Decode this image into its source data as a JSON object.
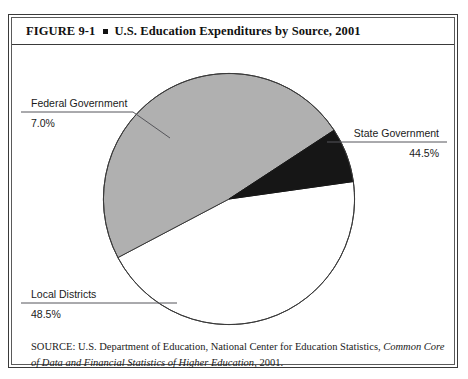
{
  "figure": {
    "number": "FIGURE  9-1",
    "separator_icon": "square-bullet-icon",
    "title": "U.S. Education Expenditures by Source, 2001"
  },
  "chart_data": {
    "type": "pie",
    "title": "U.S. Education Expenditures by Source, 2001",
    "categories": [
      "Local Districts",
      "State Government",
      "Federal Government"
    ],
    "values": [
      48.5,
      44.5,
      7.0
    ],
    "value_labels": [
      "48.5%",
      "44.5%",
      "7.0%"
    ],
    "units": "percent",
    "colors": [
      "#b0b0b0",
      "#ffffff",
      "#161616"
    ],
    "slice_order_clockwise": [
      "State Government",
      "Local Districts",
      "Federal Government"
    ],
    "start_angle_deg": -8,
    "legend": "none",
    "labels_position": "external-callouts-with-leader-lines",
    "grid": false,
    "slices": [
      {
        "name": "State Government",
        "value": 44.5,
        "label": "44.5%",
        "color": "#ffffff",
        "callout_side": "right"
      },
      {
        "name": "Local Districts",
        "value": 48.5,
        "label": "48.5%",
        "color": "#b0b0b0",
        "callout_side": "left"
      },
      {
        "name": "Federal Government",
        "value": 7.0,
        "label": "7.0%",
        "color": "#161616",
        "callout_side": "left"
      }
    ]
  },
  "callouts": {
    "federal": {
      "name": "Federal Government",
      "value": "7.0%"
    },
    "state": {
      "name": "State Government",
      "value": "44.5%"
    },
    "local": {
      "name": "Local Districts",
      "value": "48.5%"
    }
  },
  "source": {
    "prefix": "SOURCE: U.S. Department of Education, National Center for Education Statistics, ",
    "publication_italic": "Common Core of Data and Financial Statistics of Higher Education",
    "suffix": ", 2001."
  },
  "style": {
    "frame_color": "#3a3a3a",
    "gray_slice": "#b0b0b0",
    "black_slice": "#161616",
    "white_slice": "#ffffff",
    "leader_line_color": "#55555a"
  }
}
